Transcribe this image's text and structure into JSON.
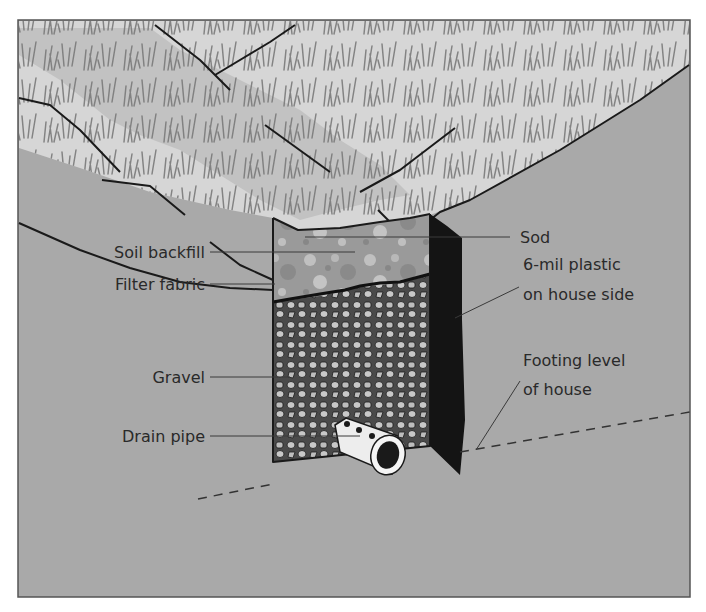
{
  "diagram": {
    "colors": {
      "background": "#ffffff",
      "ground": "#a9a9a9",
      "sod_light": "#dcdcdc",
      "sod_mid": "#c4c4c4",
      "soil_backfill": "#9a9a9a",
      "gravel_bg": "#4a4a4a",
      "gravel_stone": "#c8c8c8",
      "plastic": "#141414",
      "pipe": "#f0f0f0",
      "text": "#2a2a2a"
    },
    "labels": {
      "sod": "Sod",
      "soil_backfill": "Soil backfill",
      "filter_fabric": "Filter fabric",
      "gravel": "Gravel",
      "drain_pipe": "Drain pipe",
      "plastic_line1": "6-mil plastic",
      "plastic_line2": "on house side",
      "footing_line1": "Footing level",
      "footing_line2": "of house"
    }
  }
}
